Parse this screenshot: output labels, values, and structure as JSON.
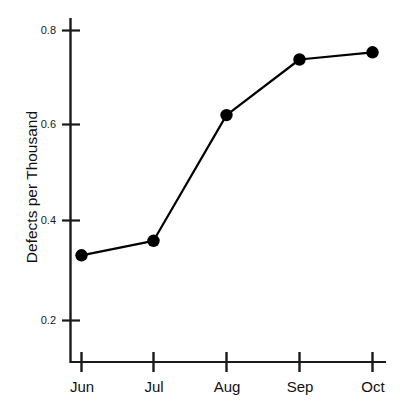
{
  "chart_data": {
    "type": "line",
    "title": "",
    "xlabel": "",
    "ylabel": "Defects per Thousand",
    "categories": [
      "Jun",
      "Jul",
      "Aug",
      "Sep",
      "Oct"
    ],
    "values": [
      0.335,
      0.365,
      0.625,
      0.74,
      0.755
    ],
    "series": [
      {
        "name": "Defects per Thousand",
        "values": [
          0.335,
          0.365,
          0.625,
          0.74,
          0.755
        ]
      }
    ],
    "yticks": [
      0.2,
      0.4,
      0.6,
      0.8
    ],
    "ytick_labels": [
      "0.2",
      "0.4",
      "0.6",
      "0.8"
    ],
    "ylim": [
      0.13,
      0.83
    ],
    "grid": false,
    "legend": false,
    "marker": "filled-circle",
    "line_color": "#000000",
    "marker_color": "#000000",
    "background_color": "#ffffff",
    "axis_color": "#1a1a1a"
  },
  "axes": {
    "y_label_text": "Defects per Thousand",
    "y_tick_labels": [
      "0.8",
      "0.6",
      "0.4",
      "0.2"
    ],
    "x_tick_labels": [
      "Jun",
      "Jul",
      "Aug",
      "Sep",
      "Oct"
    ]
  }
}
